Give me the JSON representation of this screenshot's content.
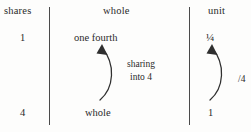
{
  "figure": {
    "type": "fraction-sharing-diagram",
    "background_color": "#fdfdfc",
    "ink_color": "#2a2a2a"
  },
  "headers": {
    "shares": "shares",
    "whole": "whole",
    "unit": "unit"
  },
  "columns": {
    "shares": {
      "top_value": "1",
      "bottom_value": "4"
    },
    "whole": {
      "top_value": "one fourth",
      "bottom_value": "whole",
      "arrow_label_line1": "sharing",
      "arrow_label_line2": "into 4"
    },
    "unit": {
      "top_value": "¼",
      "bottom_value": "1",
      "arrow_label": "/4"
    }
  },
  "dividers": [
    {
      "name": "divider-1",
      "x": 49
    },
    {
      "name": "divider-2",
      "x": 189
    }
  ],
  "arrows": [
    {
      "name": "sharing-arrow-whole",
      "direction": "upward",
      "curve": "bulge-right"
    },
    {
      "name": "sharing-arrow-unit",
      "direction": "upward",
      "curve": "bulge-right"
    }
  ]
}
